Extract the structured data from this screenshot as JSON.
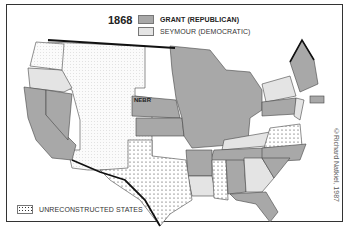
{
  "map": {
    "year": "1868",
    "legend": [
      {
        "key": "republican",
        "label": "GRANT (REPUBLICAN)",
        "color": "#a8a8a8"
      },
      {
        "key": "democratic",
        "label": "SEYMOUR (DEMOCRATIC)",
        "color": "#e4e4e4"
      }
    ],
    "bottom_legend": {
      "label": "UNRECONSTRUCTED STATES",
      "pattern": "dotted"
    },
    "state_label": "NEBR",
    "credit": "©Richard Natkiel, 1987",
    "states": {
      "republican": [
        "California",
        "Nevada",
        "Nebraska",
        "Kansas",
        "Minnesota",
        "Iowa",
        "Missouri",
        "Wisconsin",
        "Illinois",
        "Michigan",
        "Indiana",
        "Ohio",
        "West Virginia",
        "Pennsylvania",
        "Tennessee",
        "North Carolina",
        "South Carolina",
        "Alabama",
        "Arkansas",
        "Florida",
        "Maine",
        "New Hampshire",
        "Vermont",
        "Massachusetts",
        "Rhode Island",
        "Connecticut"
      ],
      "democratic": [
        "Oregon",
        "New York",
        "New Jersey",
        "Delaware",
        "Maryland",
        "Kentucky",
        "Georgia",
        "Louisiana"
      ],
      "unreconstructed": [
        "Texas",
        "Mississippi",
        "Virginia"
      ],
      "territories": [
        "Washington",
        "Idaho",
        "Montana",
        "Dakota",
        "Wyoming",
        "Utah",
        "Colorado",
        "Arizona",
        "New Mexico"
      ]
    }
  }
}
